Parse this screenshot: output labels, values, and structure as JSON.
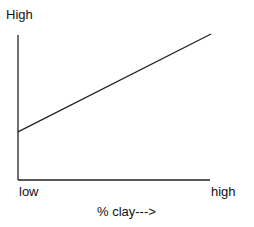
{
  "chart_data": {
    "type": "line",
    "title": "",
    "xlabel": "% clay--->",
    "ylabel": "High",
    "x_tick_labels": [
      "low",
      "high"
    ],
    "grid": false,
    "legend": null,
    "series": [
      {
        "name": "trend",
        "x": [
          0,
          1
        ],
        "y": [
          0.33,
          1.0
        ]
      }
    ],
    "xlim": [
      0,
      1
    ],
    "ylim": [
      0,
      1.0
    ],
    "colors": {
      "line": "#222222",
      "axes": "#222222"
    }
  },
  "labels": {
    "y_axis_top": "High",
    "x_low": "low",
    "x_high": "high",
    "x_title": "% clay--->"
  }
}
